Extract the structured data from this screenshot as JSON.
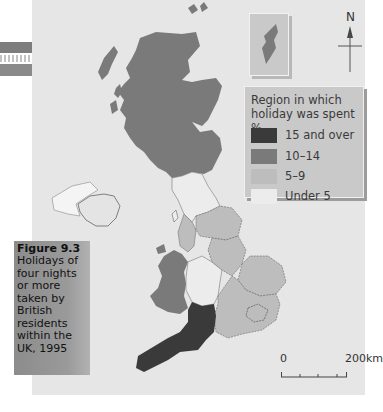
{
  "figure": {
    "label": "Figure 9.3",
    "caption": "Holidays of four nights or more taken by British residents within the UK, 1995"
  },
  "legend": {
    "title": "Region in which holiday was spent %",
    "items": [
      {
        "label": "15 and over",
        "color": "#3a3a3a"
      },
      {
        "label": "10–14",
        "color": "#7a7a7a"
      },
      {
        "label": "5–9",
        "color": "#bdbdbd"
      },
      {
        "label": "Under 5",
        "color": "#ececec"
      }
    ]
  },
  "compass": {
    "label": "N"
  },
  "scale_bar": {
    "start": "0",
    "end": "200km"
  },
  "inset": {
    "name": "shetland-inset"
  },
  "colors": {
    "background": "#e6e6e6",
    "sea": "#e6e6e6"
  }
}
